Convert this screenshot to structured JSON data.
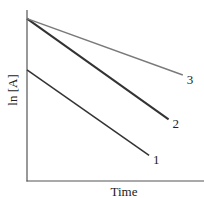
{
  "chart_data": {
    "type": "line",
    "title": "",
    "xlabel": "Time",
    "ylabel": "ln [A]",
    "xlim": [
      0,
      1
    ],
    "ylim": [
      0,
      1
    ],
    "grid": false,
    "legend": "inline-end-labels",
    "series": [
      {
        "name": "1",
        "x": [
          0,
          0.69
        ],
        "y": [
          0.65,
          0.15
        ],
        "color": "#333333"
      },
      {
        "name": "2",
        "x": [
          0,
          0.8
        ],
        "y": [
          0.95,
          0.36
        ],
        "color": "#333333"
      },
      {
        "name": "3",
        "x": [
          0,
          0.88
        ],
        "y": [
          0.95,
          0.62
        ],
        "color": "#7a7a7a"
      }
    ]
  }
}
